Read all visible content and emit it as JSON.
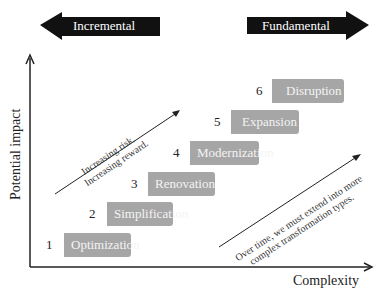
{
  "header": {
    "left_arrow": {
      "label": "Incremental",
      "direction": "left",
      "color": "#111111"
    },
    "right_arrow": {
      "label": "Fundamental",
      "direction": "right",
      "color": "#111111"
    }
  },
  "axes": {
    "y_label": "Potential impact",
    "x_label": "Complexity"
  },
  "annotations": {
    "risk": {
      "line1": "Increasing risk.",
      "line2": "Increasing reward."
    },
    "time": {
      "line1": "Over time, we must extend into more",
      "line2": "complex transformation types."
    }
  },
  "steps": [
    {
      "number": "1",
      "label": "Optimization"
    },
    {
      "number": "2",
      "label": "Simplification"
    },
    {
      "number": "3",
      "label": "Renovation"
    },
    {
      "number": "4",
      "label": "Modernization"
    },
    {
      "number": "5",
      "label": "Expansion"
    },
    {
      "number": "6",
      "label": "Disruption"
    }
  ],
  "colors": {
    "box_fill": "#a6a6a6",
    "box_text": "#f4f4f4",
    "arrow_fill": "#111111"
  }
}
